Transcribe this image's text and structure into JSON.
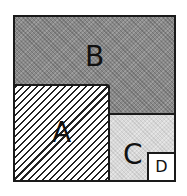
{
  "diagram": {
    "type": "nested area partition",
    "regions": [
      {
        "id": "B",
        "label": "B",
        "fill": "dark stippled gray",
        "color": "#8a8a8a"
      },
      {
        "id": "A",
        "label": "A",
        "fill": "diagonal hatching",
        "color": "#222222"
      },
      {
        "id": "C",
        "label": "C",
        "fill": "light stippled gray",
        "color": "#d9d9d9"
      },
      {
        "id": "D",
        "label": "D",
        "fill": "white",
        "color": "#ffffff"
      }
    ]
  }
}
